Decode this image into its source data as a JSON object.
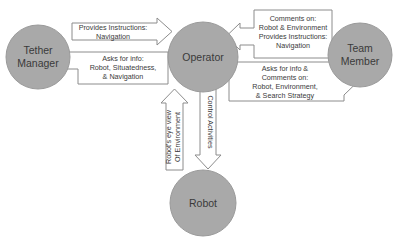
{
  "diagram": {
    "background_color": "#ffffff",
    "node_fill_color": "#a9a9a9",
    "node_stroke_color": "#9a9a9a",
    "arrow_fill_color": "#ffffff",
    "arrow_stroke_color": "#8c8c8c",
    "text_color": "#3a3a3a"
  },
  "nodes": {
    "tether_manager": {
      "line1": "Tether",
      "line2": "Manager"
    },
    "operator": {
      "line1": "Operator"
    },
    "team_member": {
      "line1": "Team",
      "line2": "Member"
    },
    "robot": {
      "line1": "Robot"
    }
  },
  "arrows": {
    "tm_to_operator": {
      "direction": "right",
      "line1": "Provides Instructions:",
      "line2": "Navigation"
    },
    "operator_to_tm": {
      "direction": "left",
      "line1": "Asks for info:",
      "line2": "Robot, Situatedness,",
      "line3": "& Navigation"
    },
    "team_to_operator": {
      "direction": "left",
      "line1": "Comments on:",
      "line2": "Robot & Environment",
      "line3": "Provides Instructions:",
      "line4": "Navigation"
    },
    "operator_to_team": {
      "direction": "right",
      "line1": "Asks for info &",
      "line2": "Comments on:",
      "line3": "Robot, Environment,",
      "line4": "& Search Strategy"
    },
    "robot_to_operator": {
      "direction": "up",
      "line1": "Robot's eye view",
      "line2": "Of Environment"
    },
    "operator_to_robot": {
      "direction": "down",
      "line1": "Control Activities"
    }
  }
}
